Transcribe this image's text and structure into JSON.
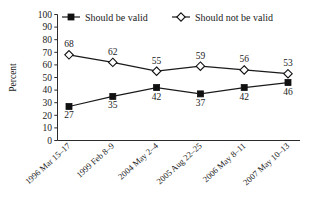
{
  "chart_data": {
    "type": "line",
    "title": "",
    "xlabel": "",
    "ylabel": "Percent",
    "ylim": [
      0,
      100
    ],
    "ytick_step": 10,
    "yticks": [
      "0",
      "10",
      "20",
      "30",
      "40",
      "50",
      "60",
      "70",
      "80",
      "90",
      "100"
    ],
    "grid": false,
    "legend_position": "top",
    "categories": [
      "1996 Mar 15–17",
      "1999 Feb 8–9",
      "2004 May 2–4",
      "2005 Aug 22–25",
      "2006 May 8–11",
      "2007 May 10–13"
    ],
    "series": [
      {
        "name": "Should be valid",
        "marker": "filled-square",
        "color": "#111111",
        "label_position": "below",
        "values": [
          27,
          35,
          42,
          37,
          42,
          46
        ],
        "value_labels": [
          "27",
          "35",
          "42",
          "37",
          "42",
          "46"
        ]
      },
      {
        "name": "Should not be valid",
        "marker": "open-diamond",
        "color": "#111111",
        "label_position": "above",
        "values": [
          68,
          62,
          55,
          59,
          56,
          53
        ],
        "value_labels": [
          "68",
          "62",
          "55",
          "59",
          "56",
          "53"
        ]
      }
    ]
  },
  "legend": {
    "items": [
      {
        "label": "Should be valid",
        "marker": "filled-square"
      },
      {
        "label": "Should not be valid",
        "marker": "open-diamond"
      }
    ]
  },
  "axes": {
    "y_title": "Percent"
  },
  "colors": {
    "background": "#ffffff",
    "ink": "#1a1a1a",
    "axis": "#2b2b2b",
    "marker_fill": "#111111",
    "marker_open_fill": "#ffffff"
  }
}
